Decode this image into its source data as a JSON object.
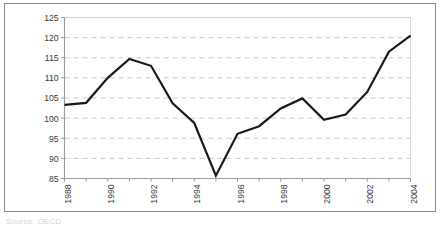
{
  "chart_data": {
    "type": "line",
    "title": "",
    "subtitle": "",
    "xlabel": "",
    "ylabel": "",
    "x": [
      1988,
      1989,
      1990,
      1991,
      1992,
      1993,
      1994,
      1995,
      1996,
      1997,
      1998,
      1999,
      2000,
      2001,
      2002,
      2003,
      2004
    ],
    "series": [
      {
        "name": "index",
        "values": [
          103.3,
          103.8,
          110.0,
          114.7,
          113.0,
          103.7,
          98.8,
          85.7,
          96.1,
          98.0,
          102.4,
          104.9,
          99.6,
          100.9,
          106.5,
          116.5,
          120.5
        ]
      }
    ],
    "xlim": [
      1988,
      2004
    ],
    "ylim": [
      85,
      125
    ],
    "ytick_values": [
      85,
      90,
      95,
      100,
      105,
      110,
      115,
      120,
      125
    ],
    "ytick_labels": [
      "85",
      "90",
      "95",
      "100",
      "105",
      "110",
      "115",
      "120",
      "125"
    ],
    "xtick_values": [
      1988,
      1989,
      1990,
      1991,
      1992,
      1993,
      1994,
      1995,
      1996,
      1997,
      1998,
      1999,
      2000,
      2001,
      2002,
      2003,
      2004
    ],
    "xtick_labels_shown": [
      "1988",
      "1990",
      "1992",
      "1994",
      "1996",
      "1998",
      "2000",
      "2002",
      "2004"
    ],
    "xtick_label_values": [
      1988,
      1990,
      1992,
      1994,
      1996,
      1998,
      2000,
      2002,
      2004
    ],
    "xtick_label_rotation": -90,
    "grid": {
      "horizontal": true,
      "vertical": false,
      "style": "dashed"
    },
    "legend": {
      "visible": false,
      "position": "none"
    },
    "line_color": "#1a1a1a",
    "line_width": 2.2,
    "grid_color": "#b9c4d6",
    "axis_color": "#9a9a9a",
    "frame_color": "#8a8a8a",
    "tick_label_color": "#3a3a3a",
    "background": "#ffffff"
  },
  "figure": {
    "source_note": "Source: OECD"
  }
}
